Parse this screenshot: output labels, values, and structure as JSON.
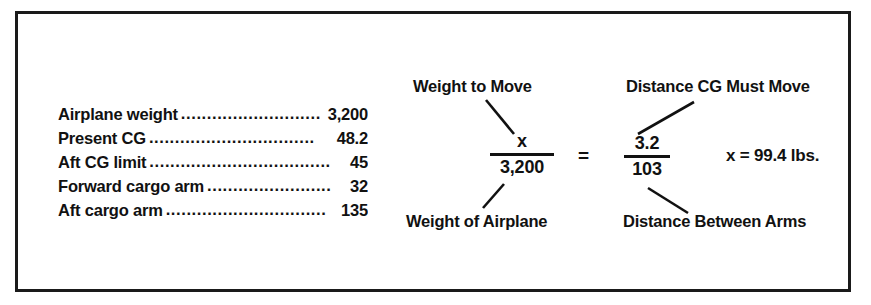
{
  "figure": {
    "border_color": "#1a1a1a",
    "background_color": "#ffffff"
  },
  "data_list": {
    "rows": [
      {
        "label": "Airplane weight",
        "leader": "...........................",
        "value": "3,200"
      },
      {
        "label": "Present CG",
        "leader": "................................",
        "value": "48.2"
      },
      {
        "label": "Aft CG limit",
        "leader": "...................................",
        "value": "45"
      },
      {
        "label": "Forward cargo arm",
        "leader": "........................",
        "value": "32"
      },
      {
        "label": "Aft cargo arm",
        "leader": "...............................",
        "value": "135"
      }
    ]
  },
  "formula": {
    "labels": {
      "weight_to_move": "Weight to Move",
      "weight_of_airplane": "Weight of Airplane",
      "distance_cg_must_move": "Distance CG Must Move",
      "distance_between_arms": "Distance Between Arms"
    },
    "left_fraction": {
      "numerator": "x",
      "denominator": "3,200"
    },
    "operator": "=",
    "right_fraction": {
      "numerator": "3.2",
      "denominator": "103"
    },
    "result": "x = 99.4 lbs."
  }
}
